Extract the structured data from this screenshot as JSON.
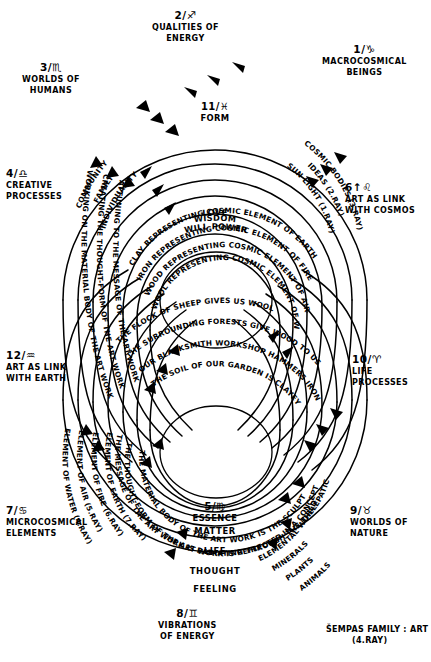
{
  "axis_labels": {
    "form": {
      "code": "11/♓",
      "name": "FORM"
    },
    "essence": {
      "code": "5/♍",
      "name": "ESSENCE"
    }
  },
  "corners": [
    {
      "id": "qualities-of-energy",
      "code": "2/♐",
      "lines": [
        "QUALITIES OF",
        "ENERGY"
      ],
      "x": 152,
      "y": 8,
      "align": "center"
    },
    {
      "id": "macrocosmical-beings",
      "code": "1/♑",
      "lines": [
        "MACROCOSMICAL",
        "BEINGS"
      ],
      "x": 322,
      "y": 42,
      "align": "center"
    },
    {
      "id": "worlds-of-humans",
      "code": "3/♏",
      "lines": [
        "WORLDS OF",
        "HUMANS"
      ],
      "x": 22,
      "y": 60,
      "align": "center"
    },
    {
      "id": "creative-processes",
      "code": "4/♎",
      "lines": [
        "CREATIVE",
        "PROCESSES"
      ],
      "x": 6,
      "y": 166,
      "align": "left"
    },
    {
      "id": "art-as-link-with-cosmos",
      "code": "6↑♌",
      "lines": [
        "ART AS LINK",
        "WITH COSMOS"
      ],
      "x": 345,
      "y": 180,
      "align": "left"
    },
    {
      "id": "art-as-link-with-earth",
      "code": "12/♒",
      "lines": [
        "ART AS LINK",
        "WITH EARTH"
      ],
      "x": 6,
      "y": 348,
      "align": "left"
    },
    {
      "id": "life-processes",
      "code": "10/♈",
      "lines": [
        "LIFE",
        "PROCESSES"
      ],
      "x": 352,
      "y": 352,
      "align": "left"
    },
    {
      "id": "microcosmical-elements",
      "code": "7/♋",
      "lines": [
        "MICROCOSMICAL",
        "ELEMENTS"
      ],
      "x": 6,
      "y": 503,
      "align": "left"
    },
    {
      "id": "worlds-of-nature",
      "code": "9/♉",
      "lines": [
        "WORLDS OF",
        "NATURE"
      ],
      "x": 350,
      "y": 503,
      "align": "left"
    },
    {
      "id": "vibrations-of-energy",
      "code": "8/♊",
      "lines": [
        "VIBRATIONS",
        "OF ENERGY"
      ],
      "x": 158,
      "y": 606,
      "align": "center"
    }
  ],
  "signature": {
    "line1": "ŠEMPAS FAMILY : ART",
    "line2": "(4.RAY)"
  },
  "top_loop": {
    "outer_left": [
      "COMMUNITY",
      "FAMILY",
      "INDIVIDUALITY"
    ],
    "outer_right": [
      "COSMIC BODIES (3.RAY)",
      "IDEAS (2.RAY)",
      "SUN LIGHT (1.RAY)"
    ],
    "top_arcs": [
      "LOVE",
      "WISDOM",
      "WILL POWER"
    ],
    "element_arcs": [
      "CLAY REPRESENTING COSMIC ELEMENT OF EARTH",
      "IRON REPRESENTING COSMIC ELEMENT OF FIRE",
      "WOOD REPRESENTING COSMIC ELEMENT OF AIR",
      "WOOL REPRESENTING COSMIC ELEMENT OF WATER"
    ],
    "crossing_arcs": [
      "WORKING ON THE MATERIAL BODY OF THE ART WORK",
      "CREATING THE THOUGHT-FORM OF THE ART WORK",
      "ATTUNING TO THE MESSAGE OF THE ART WORK"
    ]
  },
  "bottom_loop": {
    "source_arcs": [
      "THE FLOCK OF SHEEP GIVES US WOOL",
      "THE SURROUNDING FORESTS GIVE WOOD TO US",
      "OUR BLACKSMITH WORKSHOP HAMMERS IRON",
      "THE SOIL OF OUR GARDEN IS CLAYEY"
    ],
    "crossing_arcs": [
      "THE MESSAGE OF THE ART WORK IS RADIATING THROUGH THE THELEPATIC PATTERN",
      "THE THOUGHT-FORM OF THE ART WORK IS REFLECTED IN A CONCEPTUAL DRAWING",
      "THE MATERIAL BODY OF THE ART WORK IS THE SCULPTURE"
    ],
    "left_elements": [
      "ELEMENT OF EARTH (7.RAY)",
      "ELEMENT OF FIRE (6.RAY)",
      "ELEMENT OF AIR (5.RAY)",
      "ELEMENT OF WATER (4.RAY)"
    ],
    "right_worlds": [
      "ELEMENTAL WORLD",
      "MINERALS",
      "PLANTS",
      "ANIMALS"
    ],
    "bottom_arcs": [
      "MATTER",
      "LIFE",
      "THOUGHT",
      "FEELING"
    ]
  }
}
